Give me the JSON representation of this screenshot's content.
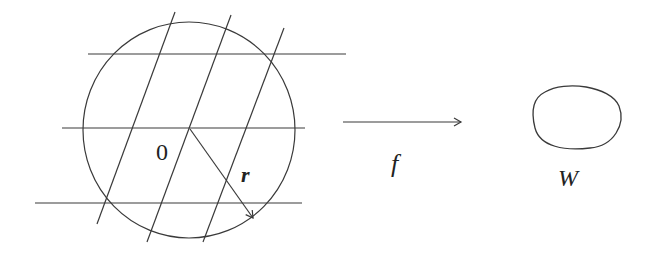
{
  "diagram": {
    "colors": {
      "stroke": "#3a3a3a",
      "text": "#222222",
      "background": "#ffffff"
    },
    "disk": {
      "center_label": "0",
      "radius_label": "r",
      "circle": {
        "cx": 189,
        "cy": 130,
        "rx": 106,
        "ry": 108
      },
      "horizontal_lines": [
        {
          "x1": 88,
          "y1": 54,
          "x2": 346,
          "y2": 54
        },
        {
          "x1": 62,
          "y1": 128,
          "x2": 305,
          "y2": 128
        },
        {
          "x1": 35,
          "y1": 203,
          "x2": 302,
          "y2": 203
        }
      ],
      "slanted_lines": [
        {
          "x1": 175,
          "y1": 12,
          "x2": 97,
          "y2": 224
        },
        {
          "x1": 231,
          "y1": 15,
          "x2": 147,
          "y2": 242
        },
        {
          "x1": 284,
          "y1": 28,
          "x2": 203,
          "y2": 242
        }
      ],
      "radius_arrow": {
        "x1": 190,
        "y1": 129,
        "x2": 253,
        "y2": 218
      }
    },
    "map_arrow": {
      "label": "f",
      "x1": 343,
      "y1": 122,
      "x2": 462,
      "y2": 122
    },
    "image_region": {
      "label": "W"
    }
  }
}
